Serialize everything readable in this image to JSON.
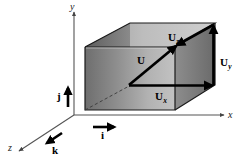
{
  "figure": {
    "background_color": "#ffffff",
    "stroke_color": "#000000",
    "axis_color": "#555555"
  },
  "axes": {
    "x_label": "x",
    "y_label": "y",
    "z_label": "z"
  },
  "vectors": {
    "resultant": {
      "symbol": "U",
      "subscript": ""
    },
    "x_component": {
      "symbol": "U",
      "subscript": "x"
    },
    "y_component": {
      "symbol": "U",
      "subscript": "y"
    },
    "z_component": {
      "symbol": "U",
      "subscript": "z"
    }
  },
  "basis": {
    "i_label": "i",
    "j_label": "j",
    "k_label": "k"
  },
  "box": {
    "top_face_color": "#b9b9b9",
    "left_face_color": "#6f6f6f",
    "front_face_color": "#a9a9a9",
    "right_face_color": "#8f8f8f",
    "edge_color": "#1a1a1a",
    "hidden_edge_style": "dashed"
  }
}
